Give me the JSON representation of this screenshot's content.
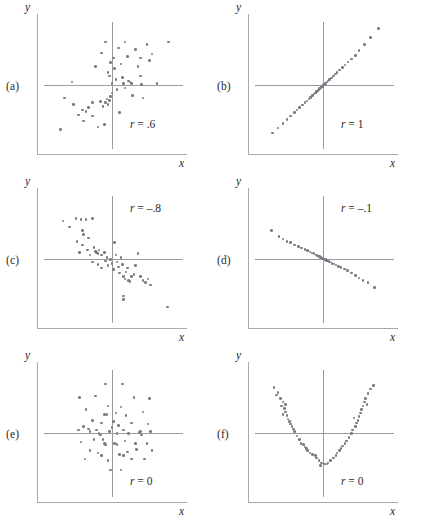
{
  "figure": {
    "type": "scatterplot-grid",
    "columns": 2,
    "rows": 3,
    "dot_color": "#7b7b85",
    "axis_color": "#9a9aa0",
    "frame_color": "#a8a8ad"
  },
  "panels": [
    {
      "letter": "(a)",
      "r_text": "r = .6",
      "r_symbol": "r",
      "r_value": " = .6",
      "x_label": "x",
      "y_label": "y"
    },
    {
      "letter": "(b)",
      "r_text": "r = 1",
      "r_symbol": "r",
      "r_value": " = 1",
      "x_label": "x",
      "y_label": "y"
    },
    {
      "letter": "(c)",
      "r_text": "r = -.8",
      "r_symbol": "r",
      "r_value": " = –.8",
      "x_label": "x",
      "y_label": "y"
    },
    {
      "letter": "(d)",
      "r_text": "r = -.1",
      "r_symbol": "r",
      "r_value": " = –.1",
      "x_label": "x",
      "y_label": "y"
    },
    {
      "letter": "(e)",
      "r_text": "r = 0",
      "r_symbol": "r",
      "r_value": " = 0",
      "x_label": "x",
      "y_label": "y"
    },
    {
      "letter": "(f)",
      "r_text": "r = 0",
      "r_symbol": "r",
      "r_value": " = 0",
      "x_label": "x",
      "y_label": "y"
    }
  ],
  "chart_data": [
    {
      "type": "scatter",
      "panel": "(a)",
      "title": "r = .6",
      "xlabel": "x",
      "ylabel": "y",
      "xlim": [
        -1,
        1
      ],
      "ylim": [
        -1,
        1
      ],
      "grid": false,
      "correlation": 0.6,
      "points": [
        [
          -0.62,
          0.04
        ],
        [
          -0.74,
          -0.22
        ],
        [
          -0.6,
          -0.33
        ],
        [
          -0.52,
          -0.5
        ],
        [
          -0.46,
          -0.42
        ],
        [
          -0.4,
          -0.45
        ],
        [
          -0.36,
          -0.38
        ],
        [
          -0.3,
          -0.52
        ],
        [
          -0.22,
          -0.7
        ],
        [
          -0.12,
          -0.66
        ],
        [
          -0.8,
          -0.74
        ],
        [
          -0.3,
          -0.3
        ],
        [
          -0.18,
          -0.28
        ],
        [
          -0.14,
          -0.36
        ],
        [
          -0.1,
          -0.3
        ],
        [
          -0.08,
          -0.24
        ],
        [
          -0.06,
          -0.33
        ],
        [
          -0.04,
          -0.26
        ],
        [
          -0.02,
          -0.2
        ],
        [
          0.0,
          -0.14
        ],
        [
          -0.26,
          0.3
        ],
        [
          -0.16,
          0.52
        ],
        [
          -0.06,
          0.2
        ],
        [
          -0.04,
          0.14
        ],
        [
          -0.02,
          0.36
        ],
        [
          0.0,
          0.02
        ],
        [
          0.02,
          0.44
        ],
        [
          0.04,
          0.26
        ],
        [
          0.06,
          0.08
        ],
        [
          0.08,
          -0.08
        ],
        [
          0.1,
          0.6
        ],
        [
          0.14,
          0.34
        ],
        [
          0.16,
          0.12
        ],
        [
          0.18,
          0.02
        ],
        [
          0.2,
          -0.06
        ],
        [
          0.24,
          0.46
        ],
        [
          0.26,
          0.06
        ],
        [
          0.28,
          0.04
        ],
        [
          0.3,
          0.02
        ],
        [
          0.32,
          -0.18
        ],
        [
          0.36,
          0.58
        ],
        [
          0.4,
          0.3
        ],
        [
          0.44,
          0.14
        ],
        [
          0.46,
          0.0
        ],
        [
          0.48,
          -0.22
        ],
        [
          0.54,
          0.66
        ],
        [
          0.58,
          0.4
        ],
        [
          0.62,
          0.5
        ],
        [
          0.7,
          0.02
        ],
        [
          0.88,
          0.7
        ],
        [
          0.2,
          0.7
        ],
        [
          -0.1,
          0.7
        ],
        [
          0.44,
          0.44
        ],
        [
          0.12,
          -0.46
        ],
        [
          -0.44,
          -0.6
        ]
      ]
    },
    {
      "type": "scatter",
      "panel": "(b)",
      "title": "r = 1",
      "xlabel": "x",
      "ylabel": "y",
      "xlim": [
        -1,
        1
      ],
      "ylim": [
        -1,
        1
      ],
      "grid": false,
      "correlation": 1.0,
      "points": [
        [
          -0.78,
          -0.8
        ],
        [
          -0.7,
          -0.72
        ],
        [
          -0.62,
          -0.64
        ],
        [
          -0.56,
          -0.58
        ],
        [
          -0.5,
          -0.52
        ],
        [
          -0.44,
          -0.46
        ],
        [
          -0.4,
          -0.42
        ],
        [
          -0.36,
          -0.38
        ],
        [
          -0.32,
          -0.34
        ],
        [
          -0.28,
          -0.3
        ],
        [
          -0.25,
          -0.27
        ],
        [
          -0.22,
          -0.24
        ],
        [
          -0.19,
          -0.21
        ],
        [
          -0.16,
          -0.18
        ],
        [
          -0.14,
          -0.16
        ],
        [
          -0.12,
          -0.14
        ],
        [
          -0.1,
          -0.12
        ],
        [
          -0.08,
          -0.1
        ],
        [
          -0.06,
          -0.08
        ],
        [
          -0.05,
          -0.07
        ],
        [
          -0.04,
          -0.06
        ],
        [
          -0.03,
          -0.05
        ],
        [
          -0.02,
          -0.04
        ],
        [
          -0.01,
          -0.03
        ],
        [
          0.0,
          -0.02
        ],
        [
          0.01,
          -0.01
        ],
        [
          0.02,
          0.0
        ],
        [
          0.03,
          0.01
        ],
        [
          0.04,
          0.02
        ],
        [
          0.06,
          0.04
        ],
        [
          0.08,
          0.06
        ],
        [
          0.1,
          0.08
        ],
        [
          0.13,
          0.11
        ],
        [
          0.16,
          0.14
        ],
        [
          0.19,
          0.17
        ],
        [
          0.22,
          0.2
        ],
        [
          0.26,
          0.24
        ],
        [
          0.3,
          0.28
        ],
        [
          0.34,
          0.32
        ],
        [
          0.39,
          0.37
        ],
        [
          0.44,
          0.42
        ],
        [
          0.5,
          0.48
        ],
        [
          0.56,
          0.56
        ],
        [
          0.64,
          0.66
        ],
        [
          0.74,
          0.78
        ],
        [
          0.86,
          0.92
        ]
      ]
    },
    {
      "type": "scatter",
      "panel": "(c)",
      "title": "r = -.8",
      "xlabel": "x",
      "ylabel": "y",
      "xlim": [
        -1,
        1
      ],
      "ylim": [
        -1,
        1
      ],
      "grid": false,
      "correlation": -0.8,
      "points": [
        [
          -0.76,
          0.62
        ],
        [
          -0.66,
          0.52
        ],
        [
          -0.56,
          0.66
        ],
        [
          -0.48,
          0.64
        ],
        [
          -0.4,
          0.64
        ],
        [
          -0.3,
          0.66
        ],
        [
          -0.46,
          0.46
        ],
        [
          -0.44,
          0.4
        ],
        [
          -0.54,
          0.28
        ],
        [
          -0.46,
          0.22
        ],
        [
          -0.5,
          0.1
        ],
        [
          -0.38,
          0.14
        ],
        [
          -0.34,
          0.06
        ],
        [
          -0.28,
          0.18
        ],
        [
          -0.26,
          0.12
        ],
        [
          -0.24,
          0.1
        ],
        [
          -0.22,
          0.08
        ],
        [
          -0.2,
          0.14
        ],
        [
          -0.16,
          0.06
        ],
        [
          -0.12,
          0.1
        ],
        [
          -0.3,
          -0.06
        ],
        [
          -0.22,
          -0.1
        ],
        [
          -0.16,
          -0.16
        ],
        [
          -0.1,
          -0.04
        ],
        [
          -0.06,
          -0.12
        ],
        [
          -0.02,
          -0.02
        ],
        [
          0.0,
          -0.08
        ],
        [
          0.02,
          -0.18
        ],
        [
          0.04,
          0.26
        ],
        [
          0.06,
          0.06
        ],
        [
          0.08,
          -0.06
        ],
        [
          0.1,
          -0.14
        ],
        [
          0.12,
          -0.24
        ],
        [
          0.14,
          0.02
        ],
        [
          0.16,
          -0.1
        ],
        [
          0.18,
          -0.3
        ],
        [
          0.2,
          -0.34
        ],
        [
          0.22,
          -0.22
        ],
        [
          0.24,
          -0.16
        ],
        [
          0.26,
          -0.36
        ],
        [
          0.28,
          -0.38
        ],
        [
          0.3,
          -0.3
        ],
        [
          0.34,
          -0.26
        ],
        [
          0.36,
          -0.12
        ],
        [
          0.4,
          0.08
        ],
        [
          0.44,
          -0.3
        ],
        [
          0.48,
          -0.36
        ],
        [
          0.52,
          -0.4
        ],
        [
          0.56,
          -0.34
        ],
        [
          0.6,
          -0.44
        ],
        [
          0.18,
          -0.62
        ],
        [
          0.18,
          -0.68
        ],
        [
          0.86,
          -0.8
        ],
        [
          -0.36,
          0.34
        ],
        [
          -0.08,
          0.02
        ]
      ]
    },
    {
      "type": "scatter",
      "panel": "(d)",
      "title": "r = -.1",
      "xlabel": "x",
      "ylabel": "y",
      "xlim": [
        -1,
        1
      ],
      "ylim": [
        -1,
        1
      ],
      "grid": false,
      "correlation": -0.1,
      "points": [
        [
          -0.8,
          0.46
        ],
        [
          -0.68,
          0.36
        ],
        [
          -0.62,
          0.32
        ],
        [
          -0.56,
          0.28
        ],
        [
          -0.5,
          0.26
        ],
        [
          -0.44,
          0.22
        ],
        [
          -0.38,
          0.2
        ],
        [
          -0.33,
          0.17
        ],
        [
          -0.28,
          0.15
        ],
        [
          -0.24,
          0.13
        ],
        [
          -0.2,
          0.11
        ],
        [
          -0.17,
          0.09
        ],
        [
          -0.14,
          0.08
        ],
        [
          -0.11,
          0.06
        ],
        [
          -0.09,
          0.05
        ],
        [
          -0.07,
          0.04
        ],
        [
          -0.05,
          0.03
        ],
        [
          -0.04,
          0.02
        ],
        [
          -0.03,
          0.015
        ],
        [
          -0.02,
          0.01
        ],
        [
          -0.01,
          0.005
        ],
        [
          0.0,
          0.0
        ],
        [
          0.01,
          -0.005
        ],
        [
          0.02,
          -0.01
        ],
        [
          0.03,
          -0.015
        ],
        [
          0.04,
          -0.02
        ],
        [
          0.05,
          -0.03
        ],
        [
          0.07,
          -0.04
        ],
        [
          0.09,
          -0.05
        ],
        [
          0.11,
          -0.06
        ],
        [
          0.14,
          -0.08
        ],
        [
          0.17,
          -0.09
        ],
        [
          0.2,
          -0.11
        ],
        [
          0.24,
          -0.13
        ],
        [
          0.28,
          -0.15
        ],
        [
          0.33,
          -0.17
        ],
        [
          0.38,
          -0.2
        ],
        [
          0.44,
          -0.24
        ],
        [
          0.5,
          -0.28
        ],
        [
          0.56,
          -0.32
        ],
        [
          0.62,
          -0.36
        ],
        [
          0.7,
          -0.4
        ],
        [
          0.8,
          -0.48
        ]
      ]
    },
    {
      "type": "scatter",
      "panel": "(e)",
      "title": "r = 0",
      "xlabel": "x",
      "ylabel": "y",
      "xlim": [
        -1,
        1
      ],
      "ylim": [
        -1,
        1
      ],
      "grid": false,
      "correlation": 0.0,
      "points": [
        [
          -0.1,
          0.8
        ],
        [
          0.16,
          0.8
        ],
        [
          -0.5,
          0.58
        ],
        [
          -0.26,
          0.6
        ],
        [
          0.34,
          0.58
        ],
        [
          0.58,
          0.56
        ],
        [
          -0.06,
          0.44
        ],
        [
          0.14,
          0.42
        ],
        [
          -0.4,
          0.38
        ],
        [
          0.48,
          0.34
        ],
        [
          -0.12,
          0.3
        ],
        [
          -0.08,
          0.3
        ],
        [
          0.06,
          0.32
        ],
        [
          0.22,
          0.28
        ],
        [
          -0.3,
          0.2
        ],
        [
          -0.16,
          0.16
        ],
        [
          0.02,
          0.18
        ],
        [
          0.1,
          0.12
        ],
        [
          0.3,
          0.16
        ],
        [
          0.56,
          0.14
        ],
        [
          -0.44,
          0.1
        ],
        [
          -0.36,
          0.06
        ],
        [
          -0.34,
          0.02
        ],
        [
          -0.24,
          0.04
        ],
        [
          -0.2,
          -0.02
        ],
        [
          -0.18,
          -0.04
        ],
        [
          -0.04,
          0.02
        ],
        [
          0.08,
          -0.02
        ],
        [
          0.18,
          0.04
        ],
        [
          0.26,
          -0.02
        ],
        [
          0.42,
          0.0
        ],
        [
          0.44,
          0.02
        ],
        [
          0.46,
          -0.04
        ],
        [
          0.6,
          0.02
        ],
        [
          -0.48,
          -0.16
        ],
        [
          -0.28,
          -0.12
        ],
        [
          -0.14,
          -0.12
        ],
        [
          -0.12,
          -0.18
        ],
        [
          -0.1,
          -0.2
        ],
        [
          0.04,
          -0.18
        ],
        [
          0.08,
          -0.2
        ],
        [
          0.2,
          -0.14
        ],
        [
          0.36,
          -0.18
        ],
        [
          0.54,
          -0.18
        ],
        [
          -0.34,
          -0.3
        ],
        [
          -0.22,
          -0.34
        ],
        [
          -0.16,
          -0.38
        ],
        [
          0.12,
          -0.36
        ],
        [
          0.18,
          -0.38
        ],
        [
          0.24,
          -0.32
        ],
        [
          0.38,
          -0.28
        ],
        [
          -0.42,
          -0.44
        ],
        [
          -0.06,
          -0.46
        ],
        [
          0.3,
          -0.44
        ],
        [
          0.5,
          -0.44
        ],
        [
          -0.02,
          -0.62
        ],
        [
          0.14,
          -0.62
        ],
        [
          0.62,
          -0.3
        ],
        [
          -0.52,
          0.04
        ],
        [
          0.0,
          0.08
        ]
      ]
    },
    {
      "type": "scatter",
      "panel": "(f)",
      "title": "r = 0",
      "xlabel": "x",
      "ylabel": "y",
      "xlim": [
        -1,
        1
      ],
      "ylim": [
        -1,
        1
      ],
      "grid": false,
      "correlation": 0.0,
      "shape": "parabola",
      "points": [
        [
          -0.76,
          0.74
        ],
        [
          -0.7,
          0.66
        ],
        [
          -0.66,
          0.56
        ],
        [
          -0.62,
          0.5
        ],
        [
          -0.64,
          0.44
        ],
        [
          -0.6,
          0.4
        ],
        [
          -0.58,
          0.34
        ],
        [
          -0.62,
          0.3
        ],
        [
          -0.56,
          0.28
        ],
        [
          -0.54,
          0.22
        ],
        [
          -0.52,
          0.18
        ],
        [
          -0.5,
          0.14
        ],
        [
          -0.48,
          0.1
        ],
        [
          -0.46,
          0.06
        ],
        [
          -0.44,
          0.02
        ],
        [
          -0.4,
          -0.06
        ],
        [
          -0.36,
          -0.12
        ],
        [
          -0.34,
          -0.18
        ],
        [
          -0.3,
          -0.2
        ],
        [
          -0.28,
          -0.24
        ],
        [
          -0.26,
          -0.26
        ],
        [
          -0.24,
          -0.3
        ],
        [
          -0.2,
          -0.34
        ],
        [
          -0.16,
          -0.36
        ],
        [
          -0.12,
          -0.38
        ],
        [
          -0.1,
          -0.42
        ],
        [
          -0.06,
          -0.46
        ],
        [
          -0.02,
          -0.5
        ],
        [
          0.02,
          -0.52
        ],
        [
          0.06,
          -0.52
        ],
        [
          0.08,
          -0.5
        ],
        [
          0.12,
          -0.46
        ],
        [
          0.16,
          -0.42
        ],
        [
          0.2,
          -0.38
        ],
        [
          0.22,
          -0.34
        ],
        [
          0.26,
          -0.3
        ],
        [
          0.28,
          -0.26
        ],
        [
          0.3,
          -0.22
        ],
        [
          0.34,
          -0.18
        ],
        [
          0.36,
          -0.14
        ],
        [
          0.4,
          -0.08
        ],
        [
          0.44,
          -0.02
        ],
        [
          0.46,
          0.04
        ],
        [
          0.5,
          0.1
        ],
        [
          0.52,
          0.16
        ],
        [
          0.54,
          0.2
        ],
        [
          0.56,
          0.26
        ],
        [
          0.58,
          0.32
        ],
        [
          0.6,
          0.38
        ],
        [
          0.62,
          0.44
        ],
        [
          0.64,
          0.5
        ],
        [
          0.66,
          0.56
        ],
        [
          0.7,
          0.64
        ],
        [
          0.74,
          0.72
        ],
        [
          0.78,
          0.78
        ],
        [
          -0.72,
          0.62
        ],
        [
          0.68,
          0.46
        ],
        [
          -0.58,
          0.46
        ],
        [
          0.48,
          0.24
        ],
        [
          -0.04,
          -0.54
        ]
      ]
    }
  ]
}
